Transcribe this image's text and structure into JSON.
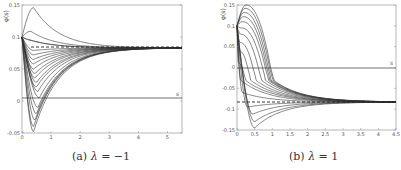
{
  "chart_data": [
    {
      "type": "line",
      "caption_prefix": "(a)",
      "caption_param": "λ = −1",
      "ylabel": "φ(s)",
      "xlabel": "s",
      "xlim": [
        0,
        5.5
      ],
      "ylim": [
        -0.05,
        0.15
      ],
      "xticks": [
        "0",
        "1",
        "2",
        "3",
        "4",
        "5"
      ],
      "yticks": [
        "0.15",
        "0.1",
        "0.05",
        "0",
        "-0.05"
      ],
      "grid": false,
      "reference_lines": [
        {
          "style": "solid",
          "y": 0
        },
        {
          "style": "dashed",
          "y": 0.083,
          "x_range": [
            0.3,
            5.5
          ]
        }
      ],
      "asymptote": 0.083,
      "series": [
        {
          "name": "curve-1",
          "start": 0.1,
          "extremum": 0.146,
          "extremum_s": 0.4
        },
        {
          "name": "curve-2",
          "start": 0.1,
          "extremum": 0.109,
          "extremum_s": 0.3
        },
        {
          "name": "curve-3",
          "start": 0.1,
          "extremum": 0.1,
          "extremum_s": 0.0
        },
        {
          "name": "curve-4",
          "start": 0.1,
          "extremum": 0.095,
          "extremum_s": 0.3
        },
        {
          "name": "curve-5",
          "start": 0.1,
          "extremum": 0.079,
          "extremum_s": 0.4
        },
        {
          "name": "curve-6",
          "start": 0.1,
          "extremum": 0.072,
          "extremum_s": 0.4
        },
        {
          "name": "curve-7",
          "start": 0.1,
          "extremum": 0.065,
          "extremum_s": 0.4
        },
        {
          "name": "curve-8",
          "start": 0.1,
          "extremum": 0.058,
          "extremum_s": 0.4
        },
        {
          "name": "curve-9",
          "start": 0.1,
          "extremum": 0.05,
          "extremum_s": 0.4
        },
        {
          "name": "curve-10",
          "start": 0.1,
          "extremum": 0.043,
          "extremum_s": 0.45
        },
        {
          "name": "curve-11",
          "start": 0.1,
          "extremum": 0.036,
          "extremum_s": 0.45
        },
        {
          "name": "curve-12",
          "start": 0.1,
          "extremum": 0.029,
          "extremum_s": 0.5
        },
        {
          "name": "curve-13",
          "start": 0.1,
          "extremum": 0.022,
          "extremum_s": 0.5
        },
        {
          "name": "curve-14",
          "start": 0.1,
          "extremum": 0.015,
          "extremum_s": 0.55
        },
        {
          "name": "curve-15",
          "start": 0.1,
          "extremum": 0.005,
          "extremum_s": 0.6
        },
        {
          "name": "curve-16",
          "start": 0.1,
          "extremum": -0.01,
          "extremum_s": 0.55
        },
        {
          "name": "curve-17",
          "start": 0.1,
          "extremum": -0.02,
          "extremum_s": 0.5
        },
        {
          "name": "curve-18",
          "start": 0.1,
          "extremum": -0.03,
          "extremum_s": 0.45
        },
        {
          "name": "curve-19",
          "start": 0.1,
          "extremum": -0.04,
          "extremum_s": 0.4
        },
        {
          "name": "curve-20",
          "start": 0.1,
          "extremum": -0.048,
          "extremum_s": 0.4
        }
      ]
    },
    {
      "type": "line",
      "caption_prefix": "(b)",
      "caption_param": "λ = 1",
      "ylabel": "φ(s)",
      "xlabel": "s",
      "xlim": [
        0,
        4.5
      ],
      "ylim": [
        -0.15,
        0.15
      ],
      "xticks": [
        "0",
        "0.5",
        "1",
        "1.5",
        "2",
        "2.5",
        "3",
        "3.5",
        "4",
        "4.5"
      ],
      "yticks": [
        "0.15",
        "0.1",
        "0.05",
        "0",
        "-0.05",
        "-0.1",
        "-0.15"
      ],
      "grid": false,
      "reference_lines": [
        {
          "style": "solid",
          "y": 0
        },
        {
          "style": "dashed",
          "y": -0.083,
          "x_range": [
            0,
            4.5
          ]
        }
      ],
      "asymptote": -0.083,
      "series": [
        {
          "name": "curve-1",
          "start": 0.1,
          "extremum": 0.15,
          "extremum_s": 0.25,
          "drop_s": 0.95
        },
        {
          "name": "curve-2",
          "start": 0.1,
          "extremum": 0.142,
          "extremum_s": 0.22,
          "drop_s": 0.92
        },
        {
          "name": "curve-3",
          "start": 0.1,
          "extremum": 0.132,
          "extremum_s": 0.2,
          "drop_s": 0.88
        },
        {
          "name": "curve-4",
          "start": 0.1,
          "extremum": 0.122,
          "extremum_s": 0.18,
          "drop_s": 0.84
        },
        {
          "name": "curve-5",
          "start": 0.1,
          "extremum": 0.11,
          "extremum_s": 0.15,
          "drop_s": 0.8
        },
        {
          "name": "curve-6",
          "start": 0.1,
          "extremum": 0.095,
          "extremum_s": 0.12,
          "drop_s": 0.72
        },
        {
          "name": "curve-7",
          "start": 0.1,
          "extremum": 0.08,
          "extremum_s": 0.1,
          "drop_s": 0.6
        },
        {
          "name": "curve-8",
          "start": 0.1,
          "extremum": 0.06,
          "extremum_s": 0.08,
          "drop_s": 0.45
        },
        {
          "name": "curve-9",
          "start": 0.1,
          "extremum": 0.04,
          "extremum_s": 0.06,
          "drop_s": 0.3
        },
        {
          "name": "curve-10",
          "start": 0.1,
          "extremum": 0.01,
          "extremum_s": 0.04,
          "drop_s": 0.15
        },
        {
          "name": "curve-11",
          "start": 0.1,
          "extremum": -0.03,
          "extremum_s": 0.1
        },
        {
          "name": "curve-12",
          "start": 0.1,
          "extremum": -0.06,
          "extremum_s": 0.15
        },
        {
          "name": "curve-13",
          "start": 0.1,
          "extremum": -0.095,
          "extremum_s": 0.3
        },
        {
          "name": "curve-14",
          "start": 0.1,
          "extremum": -0.112,
          "extremum_s": 0.45
        },
        {
          "name": "curve-15",
          "start": 0.1,
          "extremum": -0.13,
          "extremum_s": 0.5
        },
        {
          "name": "curve-16",
          "start": 0.1,
          "extremum": -0.145,
          "extremum_s": 0.5
        }
      ]
    }
  ],
  "figure": {
    "panel_a": {
      "caption_prefix": "(a)",
      "caption_lambda": "λ",
      "caption_eq": " = −1",
      "ylabel": "φ(s)",
      "s_label": "s",
      "xticks": [
        "0",
        "1",
        "2",
        "3",
        "4",
        "5"
      ],
      "yticks": [
        "0.15",
        "0.1",
        "0.05",
        "0",
        "-0.05"
      ]
    },
    "panel_b": {
      "caption_prefix": "(b)",
      "caption_lambda": "λ",
      "caption_eq": " = 1",
      "ylabel": "φ(s)",
      "s_label": "s",
      "xticks": [
        "0",
        "0.5",
        "1",
        "1.5",
        "2",
        "2.5",
        "3",
        "3.5",
        "4",
        "4.5"
      ],
      "yticks": [
        "0.15",
        "0.1",
        "0.05",
        "0",
        "-0.05",
        "-0.1",
        "-0.15"
      ]
    }
  }
}
